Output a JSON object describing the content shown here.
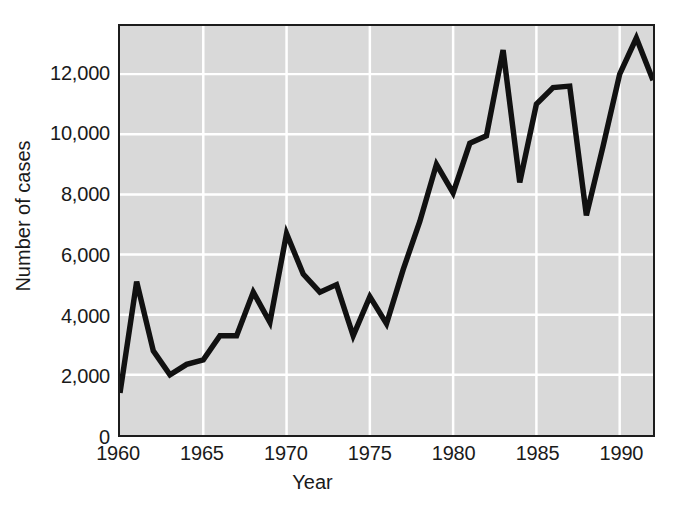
{
  "chart_data": {
    "type": "line",
    "title": "",
    "xlabel": "Year",
    "ylabel": "Number of cases",
    "xlim": [
      1960,
      1992
    ],
    "ylim": [
      0,
      13600
    ],
    "grid": true,
    "legend": "none",
    "line_color": "#111111",
    "plot_background": "#d9d9d9",
    "gridline_color": "#ffffff",
    "axis_color": "#1c1c1c",
    "x_ticks": [
      1960,
      1965,
      1970,
      1975,
      1980,
      1985,
      1990
    ],
    "x_tick_labels": [
      "1960",
      "1965",
      "1970",
      "1975",
      "1980",
      "1985",
      "1990"
    ],
    "y_ticks": [
      0,
      2000,
      4000,
      6000,
      8000,
      10000,
      12000
    ],
    "y_tick_labels": [
      "0",
      "2,000",
      "4,000",
      "6,000",
      "8,000",
      "10,000",
      "12,000"
    ],
    "x": [
      1960,
      1961,
      1962,
      1963,
      1964,
      1965,
      1966,
      1967,
      1968,
      1969,
      1970,
      1971,
      1972,
      1973,
      1974,
      1975,
      1976,
      1977,
      1978,
      1979,
      1980,
      1981,
      1982,
      1983,
      1984,
      1985,
      1986,
      1987,
      1988,
      1989,
      1990,
      1991,
      1992
    ],
    "values": [
      1400,
      5100,
      2800,
      2000,
      2350,
      2500,
      3300,
      3300,
      4750,
      3750,
      6700,
      5350,
      4750,
      5000,
      3300,
      4600,
      3700,
      5500,
      7100,
      9000,
      8050,
      9700,
      9950,
      12800,
      8400,
      11000,
      11550,
      11600,
      7300,
      9600,
      12000,
      13200,
      11800
    ],
    "series": [
      {
        "name": "Number of cases",
        "values": [
          1400,
          5100,
          2800,
          2000,
          2350,
          2500,
          3300,
          3300,
          4750,
          3750,
          6700,
          5350,
          4750,
          5000,
          3300,
          4600,
          3700,
          5500,
          7100,
          9000,
          8050,
          9700,
          9950,
          12800,
          8400,
          11000,
          11550,
          11600,
          7300,
          9600,
          12000,
          13200,
          11800
        ]
      }
    ]
  }
}
